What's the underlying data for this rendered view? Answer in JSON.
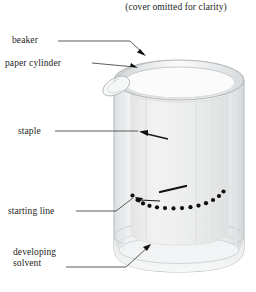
{
  "figure": {
    "caption": "(cover omitted for clarity)",
    "title_note": "paper chromatography setup in a beaker",
    "labels": [
      {
        "id": "beaker",
        "text": "beaker"
      },
      {
        "id": "paper-cylinder",
        "text": "paper cylinder"
      },
      {
        "id": "staple",
        "text": "staple"
      },
      {
        "id": "starting-line",
        "text": "starting line"
      },
      {
        "id": "developing-solvent-line1",
        "text": "developing"
      },
      {
        "id": "developing-solvent-line2",
        "text": "solvent"
      }
    ],
    "colors": {
      "background": "#ffffff",
      "text": "#1e1e1e",
      "leader_line": "#4a4a4a",
      "glass_outline": "#b9bcbe",
      "glass_fill": "#f4f5f6",
      "glass_shade": "#e4e6e8",
      "paper": "#ededee",
      "spot": "#101010"
    },
    "elements": {
      "beaker": "transparent glass beaker with pouring spout at upper left",
      "paper_cylinder": "rolled paper cylinder standing inside the beaker",
      "staple": "staple joining the paper cylinder seam",
      "starting_line": "row of sample spots marked around the base of the paper",
      "developing_solvent": "shallow layer of solvent pooled at the beaker bottom"
    }
  }
}
